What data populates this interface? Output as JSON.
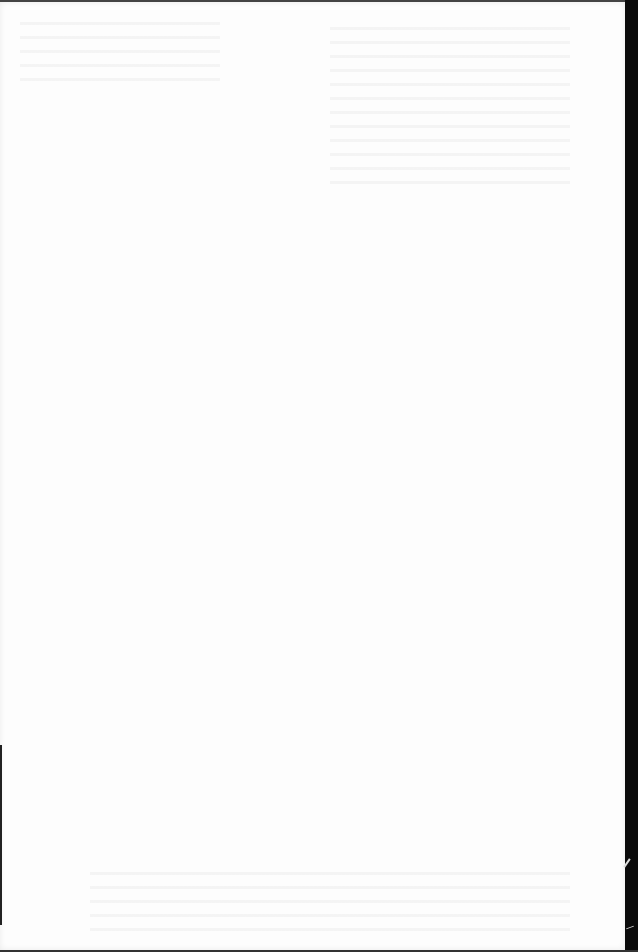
{
  "page": {
    "type": "blank-scanned-page",
    "text_content": "",
    "colors": {
      "paper": "#fdfdfd",
      "scan_border": "#0a0a0a"
    }
  }
}
